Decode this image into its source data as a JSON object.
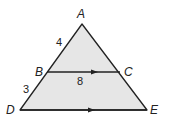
{
  "diagram": {
    "fill_color": "#e6e6e6",
    "stroke_color": "#222222",
    "points": {
      "A": {
        "label": "A",
        "x": 82,
        "y": 24
      },
      "B": {
        "label": "B",
        "x": 47,
        "y": 72
      },
      "C": {
        "label": "C",
        "x": 120,
        "y": 72
      },
      "D": {
        "label": "D",
        "x": 20,
        "y": 110
      },
      "E": {
        "label": "E",
        "x": 147,
        "y": 110
      }
    },
    "measures": {
      "AB": "4",
      "BD": "3",
      "BC": "8"
    },
    "parallel_marks": [
      "BC",
      "DE"
    ]
  }
}
